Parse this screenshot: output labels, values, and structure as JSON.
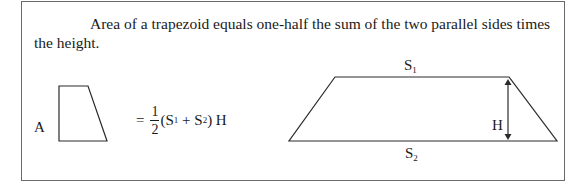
{
  "text": {
    "paragraph": "Area of a trapezoid equals one-half the sum of the two parallel sides times the height."
  },
  "formula": {
    "lhs": "A",
    "equals": "=",
    "numerator": "1",
    "denominator": "2",
    "open": "(S",
    "s1_sub": "1",
    "plus": " + S",
    "s2_sub": "2",
    "close": ") H"
  },
  "diagram": {
    "top_label": "S",
    "top_sub": "1",
    "bottom_label": "S",
    "bottom_sub": "2",
    "height_label": "H"
  },
  "colors": {
    "border": "#6a6a6a",
    "ink": "#1a1a1a"
  }
}
